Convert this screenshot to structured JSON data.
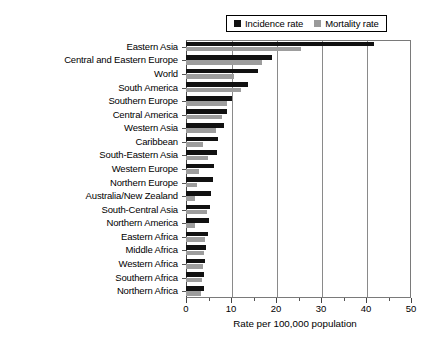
{
  "chart_data": {
    "type": "bar",
    "orientation": "horizontal",
    "title": "",
    "xlabel": "Rate per 100,000 population",
    "ylabel": "",
    "xlim": [
      0,
      50
    ],
    "xticks": [
      0,
      10,
      20,
      30,
      40,
      50
    ],
    "xtick_labels": [
      "0",
      "10",
      "20",
      "30",
      "40",
      "50"
    ],
    "minor_tick_step": 5,
    "grid": true,
    "grid_axis": "x",
    "legend_position": "top-right-outside",
    "categories": [
      "Eastern Asia",
      "Central and Eastern Europe",
      "World",
      "South America",
      "Southern Europe",
      "Central America",
      "Western Asia",
      "Caribbean",
      "South-Eastern Asia",
      "Western Europe",
      "Northern Europe",
      "Australia/New Zealand",
      "South-Central Asia",
      "Northern America",
      "Eastern Africa",
      "Middle Africa",
      "Western Africa",
      "Southern Africa",
      "Northern Africa"
    ],
    "series": [
      {
        "name": "Incidence rate",
        "color": "#111111",
        "values": [
          41.8,
          19.2,
          15.9,
          13.8,
          10.2,
          9.2,
          8.4,
          7.1,
          6.8,
          6.2,
          5.9,
          5.6,
          5.4,
          5.2,
          4.8,
          4.5,
          4.3,
          4.1,
          3.9
        ]
      },
      {
        "name": "Mortality rate",
        "color": "#9d9d9d",
        "values": [
          25.6,
          16.8,
          10.7,
          12.3,
          9.2,
          8.0,
          6.6,
          3.8,
          4.9,
          2.9,
          2.5,
          1.9,
          4.6,
          2.0,
          4.2,
          4.0,
          3.8,
          3.6,
          3.4
        ]
      }
    ],
    "legend": [
      {
        "label": "Incidence rate",
        "swatch": "black-square"
      },
      {
        "label": "Mortality rate",
        "swatch": "gray-square"
      }
    ]
  }
}
